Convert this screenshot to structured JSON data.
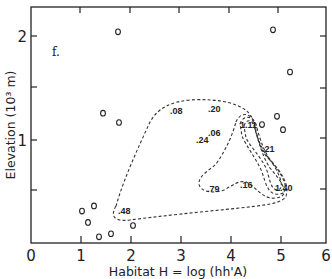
{
  "chart_data": {
    "type": "scatter",
    "panel_label": "f.",
    "title": "",
    "xlabel": "Habitat  H = log (hh'A)",
    "ylabel": "Elevation  (10³ m)",
    "xlim": [
      0,
      6
    ],
    "ylim": [
      0,
      2.35
    ],
    "x_ticks": [
      "0",
      "1",
      "2",
      "3",
      "4",
      "5",
      "6"
    ],
    "y_ticks": [
      {
        "value": 1,
        "label": "1"
      },
      {
        "value": 2,
        "label": "2"
      }
    ],
    "y_minor_ticks": [
      0.5,
      1.5
    ],
    "grid": false,
    "legend": null,
    "points": [
      {
        "x": 1.74,
        "y": 2.05
      },
      {
        "x": 1.44,
        "y": 1.26
      },
      {
        "x": 1.76,
        "y": 1.17
      },
      {
        "x": 4.84,
        "y": 2.07
      },
      {
        "x": 5.18,
        "y": 1.66
      },
      {
        "x": 4.92,
        "y": 1.23
      },
      {
        "x": 5.04,
        "y": 1.1
      },
      {
        "x": 4.62,
        "y": 1.15
      },
      {
        "x": 1.02,
        "y": 0.31
      },
      {
        "x": 1.26,
        "y": 0.36
      },
      {
        "x": 1.14,
        "y": 0.2
      },
      {
        "x": 1.36,
        "y": 0.06
      },
      {
        "x": 1.6,
        "y": 0.09
      },
      {
        "x": 2.04,
        "y": 0.17
      }
    ],
    "contour_value_labels": [
      {
        "text": ".08",
        "x": 2.82,
        "y": 1.27
      },
      {
        "text": ".20",
        "x": 3.62,
        "y": 1.29
      },
      {
        "text": ".06",
        "x": 3.62,
        "y": 1.05
      },
      {
        "text": ".24",
        "x": 3.36,
        "y": 0.98
      },
      {
        "text": "1.11",
        "x": 4.3,
        "y": 1.15
      },
      {
        "text": ".21",
        "x": 4.72,
        "y": 0.86
      },
      {
        "text": ".79",
        "x": 3.6,
        "y": 0.44
      },
      {
        "text": ".16",
        "x": 4.26,
        "y": 0.47
      },
      {
        "text": "1.40",
        "x": 5.08,
        "y": 0.45
      },
      {
        "text": ".48",
        "x": 1.88,
        "y": 0.33
      }
    ],
    "contours": [
      {
        "level": "outer",
        "style": "dashed"
      },
      {
        "level": "inner-1",
        "style": "dashed"
      },
      {
        "level": "inner-2",
        "style": "dashed"
      },
      {
        "level": "inner-3",
        "style": "dashed"
      }
    ]
  }
}
